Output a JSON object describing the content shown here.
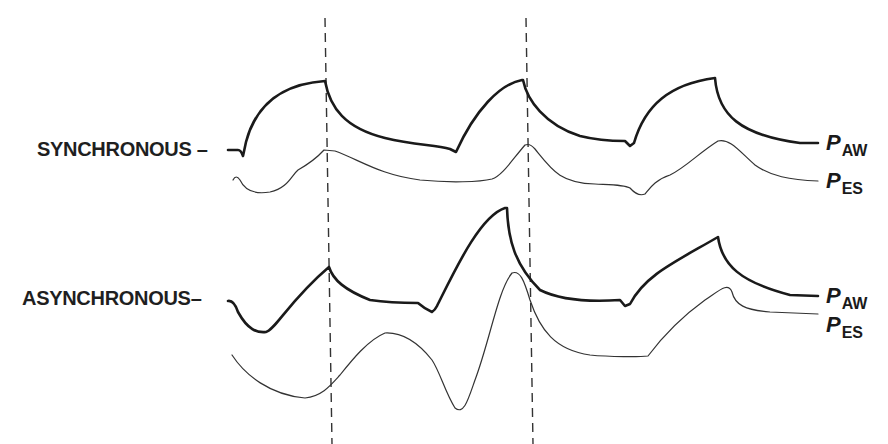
{
  "diagram": {
    "markers": {
      "dashed_lines": 2
    },
    "panels": [
      {
        "id": "synchronous",
        "title": "SYNCHRONOUS",
        "traces": [
          {
            "id": "paw",
            "symbol": "P",
            "subscript": "AW",
            "weight": "thick"
          },
          {
            "id": "pes",
            "symbol": "P",
            "subscript": "ES",
            "weight": "thin"
          }
        ]
      },
      {
        "id": "asynchronous",
        "title": "ASYNCHRONOUS",
        "traces": [
          {
            "id": "paw",
            "symbol": "P",
            "subscript": "AW",
            "weight": "thick"
          },
          {
            "id": "pes",
            "symbol": "P",
            "subscript": "ES",
            "weight": "thin"
          }
        ]
      }
    ]
  }
}
